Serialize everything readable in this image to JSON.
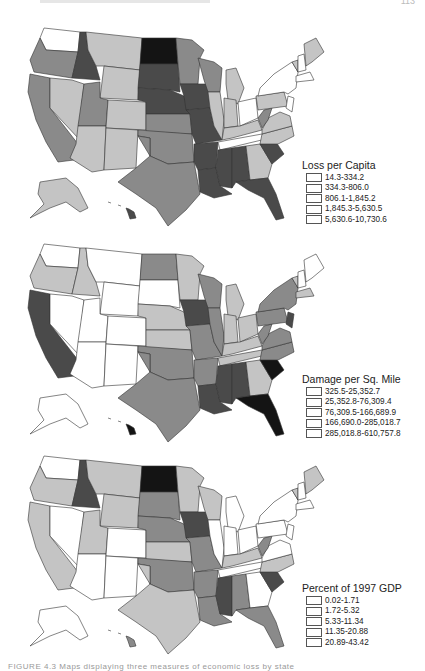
{
  "page": {
    "page_number": "113",
    "caption_fragment": "FIGURE 4.3 Maps displaying three measures of economic loss by state"
  },
  "palette": {
    "class_0": "#ffffff",
    "class_1": "#c4c4c4",
    "class_2": "#8a8a8a",
    "class_3": "#4a4a4a",
    "class_4": "#141414"
  },
  "maps": [
    {
      "id": "loss-per-capita",
      "legend": {
        "title": "Loss per Capita",
        "classes": [
          "14.3-334.2",
          "334.3-806.0",
          "806.1-1,845.2",
          "1,845.3-5,630.5",
          "5,630.6-10,730.6"
        ]
      },
      "states": {
        "WA": 0,
        "OR": 2,
        "CA": 2,
        "NV": 1,
        "ID": 3,
        "MT": 1,
        "WY": 1,
        "UT": 2,
        "AZ": 1,
        "CO": 1,
        "NM": 1,
        "ND": 4,
        "SD": 3,
        "NE": 3,
        "KS": 2,
        "OK": 2,
        "TX": 2,
        "MN": 2,
        "IA": 3,
        "MO": 3,
        "AR": 3,
        "LA": 3,
        "WI": 2,
        "IL": 1,
        "MI": 1,
        "IN": 1,
        "OH": 0,
        "KY": 1,
        "TN": 0,
        "MS": 3,
        "AL": 3,
        "GA": 1,
        "FL": 3,
        "SC": 3,
        "NC": 1,
        "VA": 1,
        "WV": 2,
        "PA": 1,
        "NY": 0,
        "VT": 1,
        "NH": 0,
        "ME": 1,
        "MA": 0,
        "NJ": 0,
        "AK": 1,
        "HI": 3
      }
    },
    {
      "id": "damage-per-sq-mile",
      "legend": {
        "title": "Damage per Sq. Mile",
        "classes": [
          "325.5-25,352.7",
          "25,352.8-76,309.4",
          "76,309.5-166,689.9",
          "166,690.0-285,018.7",
          "285,018.8-610,757.8"
        ]
      },
      "states": {
        "WA": 0,
        "OR": 1,
        "CA": 3,
        "NV": 0,
        "ID": 1,
        "MT": 0,
        "WY": 0,
        "UT": 0,
        "AZ": 0,
        "CO": 0,
        "NM": 0,
        "ND": 2,
        "SD": 0,
        "NE": 1,
        "KS": 1,
        "OK": 2,
        "TX": 2,
        "MN": 1,
        "IA": 3,
        "MO": 2,
        "AR": 2,
        "LA": 3,
        "WI": 2,
        "IL": 2,
        "MI": 1,
        "IN": 1,
        "OH": 1,
        "KY": 1,
        "TN": 1,
        "MS": 3,
        "AL": 3,
        "GA": 1,
        "FL": 4,
        "SC": 4,
        "NC": 2,
        "VA": 2,
        "WV": 2,
        "PA": 2,
        "NY": 2,
        "VT": 1,
        "NH": 0,
        "ME": 0,
        "MA": 1,
        "NJ": 3,
        "AK": 0,
        "HI": 4
      }
    },
    {
      "id": "percent-of-1997-gdp",
      "legend": {
        "title": "Percent of 1997 GDP",
        "classes": [
          "0.02-1.71",
          "1.72-5.32",
          "5.33-11.34",
          "11.35-20.88",
          "20.89-43.42"
        ]
      },
      "states": {
        "WA": 0,
        "OR": 1,
        "CA": 1,
        "NV": 0,
        "ID": 3,
        "MT": 1,
        "WY": 1,
        "UT": 1,
        "AZ": 0,
        "CO": 0,
        "NM": 0,
        "ND": 4,
        "SD": 2,
        "NE": 2,
        "KS": 1,
        "OK": 2,
        "TX": 1,
        "MN": 1,
        "IA": 3,
        "MO": 2,
        "AR": 2,
        "LA": 2,
        "WI": 1,
        "IL": 0,
        "MI": 0,
        "IN": 0,
        "OH": 0,
        "KY": 1,
        "TN": 0,
        "MS": 3,
        "AL": 2,
        "GA": 0,
        "FL": 2,
        "SC": 3,
        "NC": 1,
        "VA": 0,
        "WV": 2,
        "PA": 0,
        "NY": 0,
        "VT": 1,
        "NH": 0,
        "ME": 1,
        "MA": 0,
        "NJ": 0,
        "AK": 0,
        "HI": 2
      }
    }
  ]
}
